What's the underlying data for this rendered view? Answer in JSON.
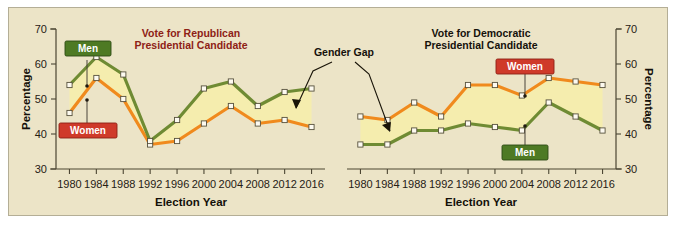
{
  "figure": {
    "background_color": "#ece4c7",
    "border_color": "#b4ae96"
  },
  "colors": {
    "men_line": "#6f8b33",
    "women_line": "#f08a1d",
    "band_fill": "#f5edae",
    "republican_title": "#8e2116",
    "democratic_title": "#15110b",
    "men_badge": "#4e7a24",
    "women_badge": "#cf3a2a"
  },
  "annotation": {
    "gender_gap_label": "Gender Gap"
  },
  "legend": {
    "men_label": "Men",
    "women_label": "Women"
  },
  "axis": {
    "y_title": "Percentage",
    "x_title": "Election Year",
    "y_ticks": [
      "70",
      "60",
      "50",
      "40",
      "30"
    ],
    "x_ticks": [
      "1980",
      "1984",
      "1988",
      "1992",
      "1996",
      "2000",
      "2004",
      "2008",
      "2012",
      "2016"
    ]
  },
  "chart_data": [
    {
      "type": "line",
      "title": "Vote for Republican Presidential Candidate",
      "title_line1": "Vote for Republican",
      "title_line2": "Presidential Candidate",
      "xlabel": "Election Year",
      "ylabel": "Percentage",
      "ylim": [
        30,
        70
      ],
      "yticks": [
        30,
        40,
        50,
        60,
        70
      ],
      "grid": false,
      "legend_position": "inline-labels",
      "categories": [
        "1980",
        "1984",
        "1988",
        "1992",
        "1996",
        "2000",
        "2004",
        "2008",
        "2012",
        "2016"
      ],
      "series": [
        {
          "name": "Men",
          "color": "#6f8b33",
          "values": [
            54,
            62,
            57,
            38,
            44,
            53,
            55,
            48,
            52,
            53
          ]
        },
        {
          "name": "Women",
          "color": "#f08a1d",
          "values": [
            46,
            56,
            50,
            37,
            38,
            43,
            48,
            43,
            44,
            42
          ]
        }
      ]
    },
    {
      "type": "line",
      "title": "Vote for Democratic Presidential Candidate",
      "title_line1": "Vote for Democratic",
      "title_line2": "Presidential Candidate",
      "xlabel": "Election Year",
      "ylabel": "Percentage",
      "ylim": [
        30,
        70
      ],
      "yticks": [
        30,
        40,
        50,
        60,
        70
      ],
      "grid": false,
      "legend_position": "inline-labels",
      "categories": [
        "1980",
        "1984",
        "1988",
        "1992",
        "1996",
        "2000",
        "2004",
        "2008",
        "2012",
        "2016"
      ],
      "series": [
        {
          "name": "Women",
          "color": "#f08a1d",
          "values": [
            45,
            44,
            49,
            45,
            54,
            54,
            51,
            56,
            55,
            54
          ]
        },
        {
          "name": "Men",
          "color": "#6f8b33",
          "values": [
            37,
            37,
            41,
            41,
            43,
            42,
            41,
            49,
            45,
            41
          ]
        }
      ]
    }
  ]
}
